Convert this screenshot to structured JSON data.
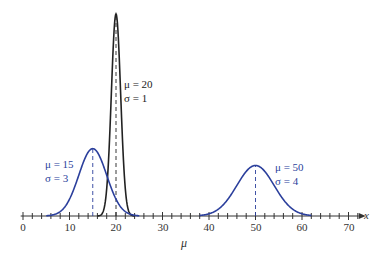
{
  "chart_data": {
    "type": "line",
    "title": "",
    "xlabel": "μ",
    "axis_name": "x",
    "xlim": [
      0,
      72
    ],
    "xticks": [
      0,
      10,
      20,
      30,
      40,
      50,
      60,
      70
    ],
    "minor_tick_step": 2,
    "grid": false,
    "series": [
      {
        "name": "μ = 20, σ = 1",
        "mu": 20,
        "sigma": 1,
        "color": "#222222",
        "label_mu": "μ = 20",
        "label_sigma": "σ = 1",
        "x_range": [
          16,
          24
        ]
      },
      {
        "name": "μ = 15, σ = 3",
        "mu": 15,
        "sigma": 3,
        "color": "#2b3f9c",
        "label_mu": "μ = 15",
        "label_sigma": "σ = 3",
        "x_range": [
          5,
          25
        ]
      },
      {
        "name": "μ = 50, σ = 4",
        "mu": 50,
        "sigma": 4,
        "color": "#2b3f9c",
        "label_mu": "μ = 50",
        "label_sigma": "σ = 4",
        "x_range": [
          38,
          62
        ]
      }
    ],
    "annotations": [
      "dashed vertical lines at each mean μ"
    ]
  },
  "labels": {
    "tick": [
      "0",
      "10",
      "20",
      "30",
      "40",
      "50",
      "60",
      "70"
    ],
    "xlabel": "μ",
    "axis_name": "x",
    "s20_mu": "μ = 20",
    "s20_sigma": "σ = 1",
    "s15_mu": "μ = 15",
    "s15_sigma": "σ = 3",
    "s50_mu": "μ = 50",
    "s50_sigma": "σ = 4"
  }
}
